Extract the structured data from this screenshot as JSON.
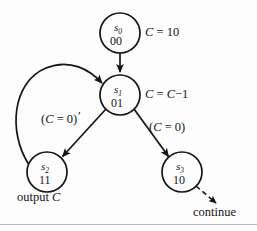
{
  "figure": {
    "type": "state-transition-diagram",
    "background_color": "#fdfdfd",
    "ink_color": "#151515"
  },
  "states": [
    {
      "id": "s0",
      "name": "s",
      "subscript": "0",
      "code": "00",
      "cx": 120,
      "cy": 33,
      "r": 20,
      "annotation": "C = 10"
    },
    {
      "id": "s1",
      "name": "s",
      "subscript": "1",
      "code": "01",
      "cx": 120,
      "cy": 95,
      "r": 20,
      "annotation": "C = C−1"
    },
    {
      "id": "s2",
      "name": "s",
      "subscript": "2",
      "code": "11",
      "cx": 47,
      "cy": 172,
      "r": 20,
      "annotation": "output C"
    },
    {
      "id": "s3",
      "name": "s",
      "subscript": "3",
      "code": "10",
      "cx": 182,
      "cy": 172,
      "r": 20,
      "annotation": "continue"
    }
  ],
  "transitions": [
    {
      "id": "s0-to-s1",
      "from": "s0",
      "to": "s1",
      "style": "solid",
      "label": ""
    },
    {
      "id": "s1-to-s2",
      "from": "s1",
      "to": "s2",
      "style": "solid",
      "label": "(C = 0)",
      "label_prime": "′"
    },
    {
      "id": "s1-to-s3",
      "from": "s1",
      "to": "s3",
      "style": "solid",
      "label": "(C = 0)"
    },
    {
      "id": "s2-to-s1",
      "from": "s2",
      "to": "s1",
      "style": "solid-curved",
      "label": ""
    },
    {
      "id": "s3-to-continue",
      "from": "s3",
      "to": "continue",
      "style": "dashed",
      "label": "continue"
    }
  ],
  "labels": {
    "c_init": {
      "var": "C",
      "rest": "= 10"
    },
    "c_decrement": {
      "var": "C",
      "mid": "=",
      "var2": "C",
      "rest": "−1"
    },
    "cond_not_zero_open": "(",
    "cond_var": "C",
    "cond_eq_zero": "= 0)",
    "prime_mark": "′",
    "output": {
      "word": "output",
      "var": "C"
    },
    "continue": "continue"
  }
}
